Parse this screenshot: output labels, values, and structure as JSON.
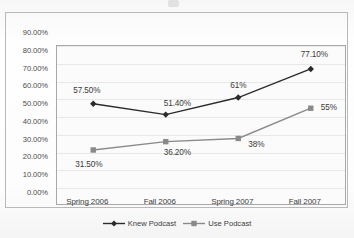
{
  "chart_data": {
    "type": "line",
    "title": "",
    "xlabel": "",
    "ylabel": "",
    "categories": [
      "Spring 2006",
      "Fall 2006",
      "Spring 2007",
      "Fall 2007"
    ],
    "ylim": [
      0,
      90
    ],
    "ytick_labels": [
      "90.00%",
      "80.00%",
      "70.00%",
      "60.00%",
      "50.00%",
      "40.00%",
      "30.00%",
      "20.00%",
      "10.00%",
      "0.00%"
    ],
    "ytick_values": [
      90,
      80,
      70,
      60,
      50,
      40,
      30,
      20,
      10,
      0
    ],
    "grid": true,
    "legend_position": "bottom",
    "series": [
      {
        "name": "Knew Podcast",
        "marker": "diamond",
        "color": "#2b2b2b",
        "values": [
          57.5,
          51.4,
          61.0,
          77.1
        ],
        "data_labels": [
          "57.50%",
          "51.40%",
          "61%",
          "77.10%"
        ]
      },
      {
        "name": "Use Podcast",
        "marker": "square",
        "color": "#8a8a8a",
        "values": [
          31.5,
          36.2,
          38.0,
          55.0
        ],
        "data_labels": [
          "31.50%",
          "36.20%",
          "38%",
          "55%"
        ]
      }
    ]
  },
  "legend": {
    "entries": [
      {
        "label": "Knew Podcast"
      },
      {
        "label": "Use Podcast"
      }
    ]
  }
}
